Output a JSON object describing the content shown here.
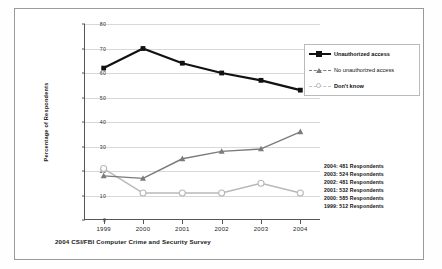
{
  "figure": {
    "caption": "2004 CSI/FBI Computer Crime and Security Survey"
  },
  "legend": {
    "position": "right",
    "items": [
      {
        "label": "Unauthorized access",
        "marker": "square-marker",
        "color": "#111111",
        "bold": true
      },
      {
        "label": "No unauthorized access",
        "marker": "triangle-marker",
        "color": "#7b7b7b",
        "bold": false
      },
      {
        "label": "Don't know",
        "marker": "circle-marker",
        "color": "#b9b9b9",
        "bold": true
      }
    ]
  },
  "respondents": {
    "lines": [
      "2004: 481 Respondents",
      "2003: 524 Respondents",
      "2002: 481 Respondents",
      "2001: 532 Respondents",
      "2000: 585 Respondents",
      "1999: 512 Respondents"
    ]
  },
  "axis": {
    "y_ticks": [
      "0",
      "10",
      "20",
      "30",
      "40",
      "50",
      "60",
      "70",
      "80"
    ],
    "x_ticks": [
      "1999",
      "2000",
      "2001",
      "2002",
      "2003",
      "2004"
    ],
    "y_title": "Percentage of Respondents"
  },
  "chart_data": {
    "type": "line",
    "title": "",
    "xlabel": "",
    "ylabel": "Percentage of Respondents",
    "ylim": [
      0,
      80
    ],
    "grid": true,
    "legend_position": "right",
    "categories": [
      "1999",
      "2000",
      "2001",
      "2002",
      "2003",
      "2004"
    ],
    "series": [
      {
        "name": "Unauthorized access",
        "values": [
          62,
          70,
          64,
          60,
          57,
          53
        ],
        "color": "#111111",
        "marker": "square"
      },
      {
        "name": "No unauthorized access",
        "values": [
          18,
          17,
          25,
          28,
          29,
          36
        ],
        "color": "#7b7b7b",
        "marker": "triangle"
      },
      {
        "name": "Don't know",
        "values": [
          21,
          11,
          11,
          11,
          15,
          11
        ],
        "color": "#b9b9b9",
        "marker": "circle"
      }
    ]
  }
}
